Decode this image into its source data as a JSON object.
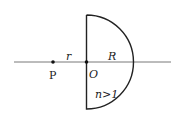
{
  "diagram": {
    "type": "optics-hemisphere",
    "labels": {
      "point_p": "P",
      "distance_r": "r",
      "center_o": "O",
      "radius_r": "R",
      "index": "n>1"
    },
    "colors": {
      "stroke": "#222222",
      "background": "#ffffff"
    },
    "geometry": {
      "axis_y": 62,
      "axis_x_start": 14,
      "axis_x_end": 171,
      "flat_face_x": 86.5,
      "radius_px": 47,
      "point_p_x": 53
    }
  }
}
